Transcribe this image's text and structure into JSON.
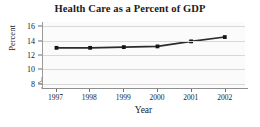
{
  "chart_data": {
    "type": "line",
    "title": "Health Care as a Percent of GDP",
    "xlabel": "Year",
    "ylabel": "Percent",
    "categories": [
      "1997",
      "1998",
      "1999",
      "2000",
      "2001",
      "2002"
    ],
    "x": [
      1997,
      1998,
      1999,
      2000,
      2001,
      2002
    ],
    "values": [
      13.0,
      13.0,
      13.1,
      13.2,
      13.9,
      14.5
    ],
    "series": [
      {
        "name": "Health Care as a Percent of GDP",
        "values": [
          13.0,
          13.0,
          13.1,
          13.2,
          13.9,
          14.5
        ]
      }
    ],
    "ylim": [
      7.4,
      16.6
    ],
    "yticks": [
      8,
      10,
      12,
      14,
      16
    ],
    "ytick_labels": [
      "8",
      "10",
      "12",
      "14",
      "16"
    ],
    "xlim": [
      1996.6,
      2002.6
    ],
    "grid": true,
    "grid_axis": "y",
    "legend": false,
    "legend_position": "none",
    "y_axis_break": true,
    "marker": "square",
    "line_color": "#2b2b2b",
    "marker_color": "#151515",
    "grid_color": "#d8d8d8",
    "plot_background": "#fbfbfb",
    "axis_color": "#8f8f8f",
    "text_color": "#1a1a1a"
  }
}
